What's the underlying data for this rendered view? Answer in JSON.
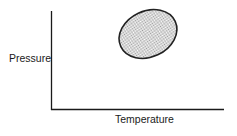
{
  "diagram": {
    "type": "phase-region-sketch",
    "x_axis": {
      "label": "Temperature"
    },
    "y_axis": {
      "label": "Pressure"
    },
    "region": {
      "shape": "ellipse",
      "fill": "stippled",
      "orientation": "tilted, long axis from lower-left to upper-right",
      "position": "upper-right quadrant of plot area"
    },
    "colors": {
      "axis": "#1a1a1a",
      "outline": "#222222",
      "stipple": "#9a9a9a",
      "background": "#ffffff"
    }
  }
}
